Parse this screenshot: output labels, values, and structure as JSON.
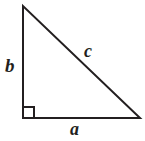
{
  "figure": {
    "name": "right-triangle",
    "background_color": "#ffffff",
    "stroke_color": "#231f20",
    "stroke_width": 2,
    "width": 145,
    "height": 141
  },
  "geometry": {
    "vertices": {
      "top": {
        "x": 23,
        "y": 6
      },
      "bottom_left": {
        "x": 23,
        "y": 118
      },
      "bottom_right": {
        "x": 140,
        "y": 118
      }
    },
    "right_angle_marker": {
      "x": 23,
      "y": 107,
      "size": 11,
      "at_vertex": "bottom_left"
    },
    "paths": {
      "triangle": "M23,6 L23,118 L140,118 Z",
      "right_angle": "M23,107 L34,107 L34,118"
    }
  },
  "labels": {
    "leg_vertical": "b",
    "hypotenuse": "c",
    "leg_horizontal": "a"
  }
}
